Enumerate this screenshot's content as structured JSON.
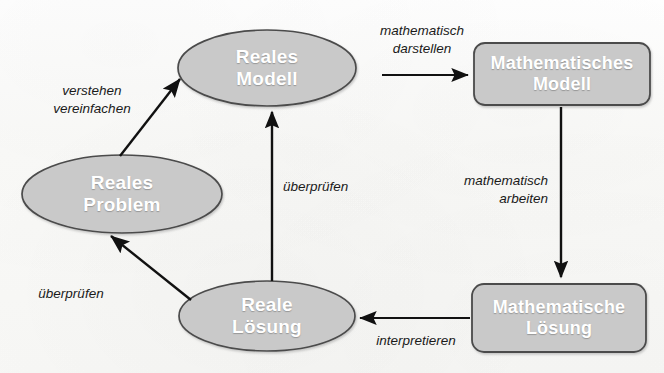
{
  "diagram": {
    "background_color": "#fbfbfa",
    "node_fill_color": "#c9c9c9",
    "node_stroke_color": "#4a4a4a",
    "node_text_color": "#ffffff",
    "edge_color": "#111111",
    "nodes": [
      {
        "id": "reales-problem",
        "shape": "ellipse",
        "line1": "Reales",
        "line2": "Problem",
        "font_size": 19
      },
      {
        "id": "reales-modell",
        "shape": "ellipse",
        "line1": "Reales",
        "line2": "Modell",
        "font_size": 19
      },
      {
        "id": "mathematisches-modell",
        "shape": "rounded-rect",
        "line1": "Mathematisches",
        "line2": "Modell",
        "font_size": 18
      },
      {
        "id": "mathematische-loesung",
        "shape": "rounded-rect",
        "line1": "Mathematische",
        "line2": "Lösung",
        "font_size": 18
      },
      {
        "id": "reale-loesung",
        "shape": "ellipse",
        "line1": "Reale",
        "line2": "Lösung",
        "font_size": 19
      }
    ],
    "edges": [
      {
        "id": "verstehen-vereinfachen",
        "from": "reales-problem",
        "to": "reales-modell",
        "line1": "verstehen",
        "line2": "vereinfachen",
        "align": "center"
      },
      {
        "id": "mathematisch-darstellen",
        "from": "reales-modell",
        "to": "mathematisches-modell",
        "line1": "mathematisch",
        "line2": "darstellen",
        "align": "center"
      },
      {
        "id": "mathematisch-arbeiten",
        "from": "mathematisches-modell",
        "to": "mathematische-loesung",
        "line1": "mathematisch",
        "line2": "arbeiten",
        "align": "right"
      },
      {
        "id": "interpretieren",
        "from": "mathematische-loesung",
        "to": "reale-loesung",
        "line1": "interpretieren",
        "line2": "",
        "align": "center"
      },
      {
        "id": "ueberpruefen-links",
        "from": "reale-loesung",
        "to": "reales-problem",
        "line1": "überprüfen",
        "line2": "",
        "align": "center"
      },
      {
        "id": "ueberpruefen-mitte",
        "from": "reale-loesung",
        "to": "reales-modell",
        "line1": "überprüfen",
        "line2": "",
        "align": "center"
      }
    ]
  }
}
